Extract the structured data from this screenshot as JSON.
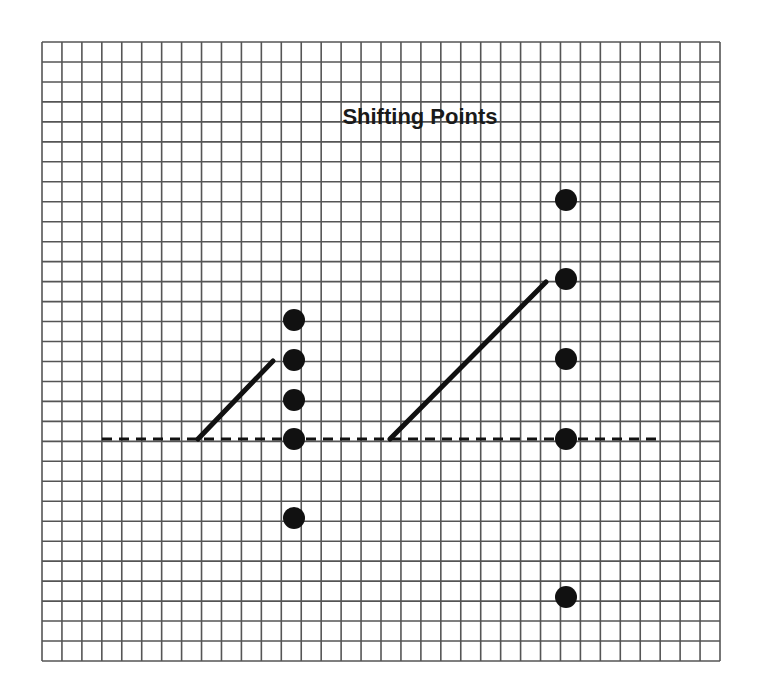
{
  "title": "Shifting Points",
  "colors": {
    "background": "#ffffff",
    "grid": "#555555",
    "ink": "#111111"
  },
  "grid": {
    "left": 42,
    "top": 42,
    "right": 720,
    "bottom": 661,
    "cols": 34,
    "rows": 31
  },
  "baseline": {
    "x1": 102,
    "x2": 660,
    "y": 439,
    "style": "dashed"
  },
  "left_group": {
    "column_x": 294,
    "points_y": [
      320,
      360,
      400,
      439,
      518
    ],
    "arrow_line": {
      "x1": 198,
      "y1": 439,
      "x2": 273,
      "y2": 361
    }
  },
  "right_group": {
    "column_x": 566,
    "points_y": [
      200,
      279,
      359,
      439,
      597
    ],
    "arrow_line": {
      "x1": 390,
      "y1": 439,
      "x2": 546,
      "y2": 282
    }
  },
  "chart_data": {
    "type": "scatter",
    "title": "Shifting Points",
    "xlabel": "",
    "ylabel": "",
    "grid": true,
    "units": "grid cells relative to dashed baseline (up = positive)",
    "series": [
      {
        "name": "left column",
        "x": [
          0,
          0,
          0,
          0,
          0
        ],
        "y": [
          6,
          4,
          2,
          0,
          -4
        ]
      },
      {
        "name": "right column",
        "x": [
          1,
          1,
          1,
          1,
          1
        ],
        "y": [
          12,
          8,
          4,
          0,
          -8
        ]
      }
    ],
    "annotations": [
      "dashed horizontal baseline",
      "diagonal line rising to second-from-top left point",
      "diagonal line rising to second-from-top right point"
    ]
  }
}
